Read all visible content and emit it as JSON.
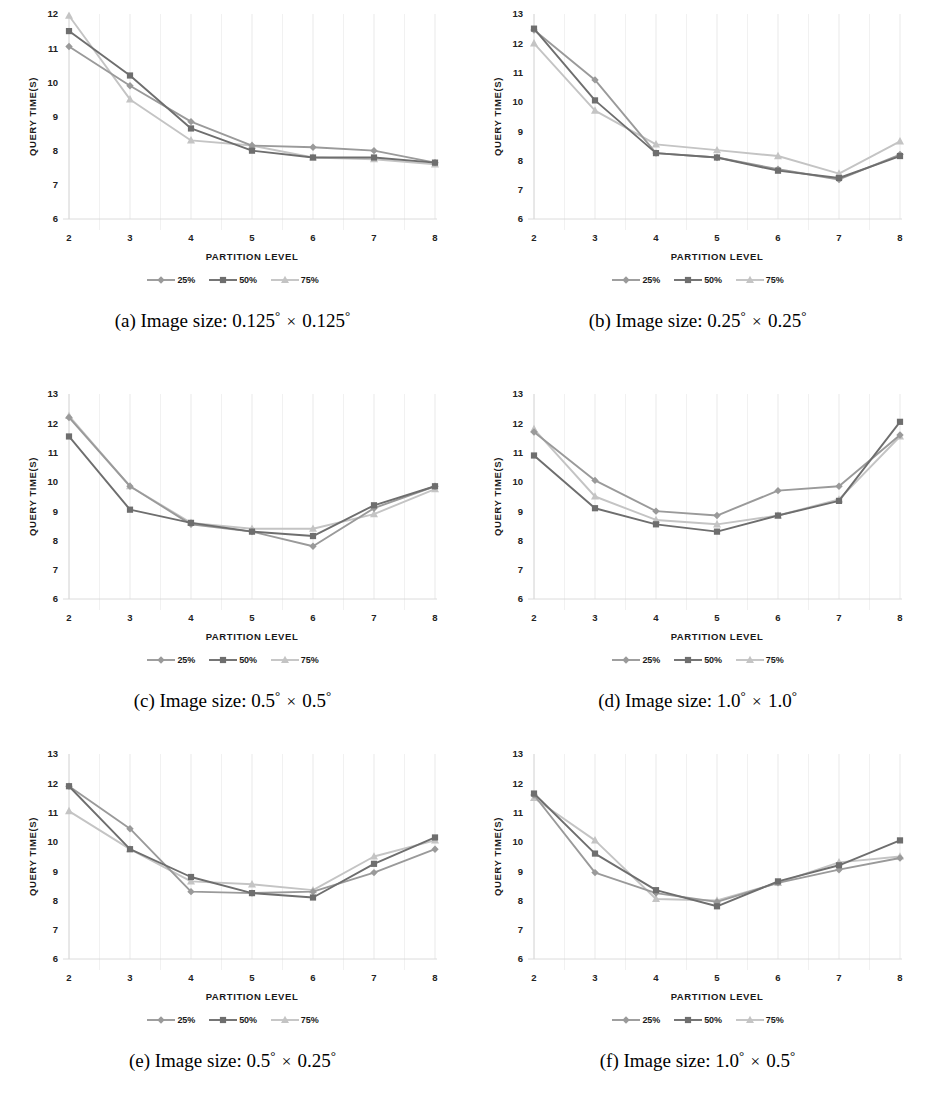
{
  "figure": {
    "series_colors": {
      "25%": "#9a9a9a",
      "50%": "#6e6e6e",
      "75%": "#c4c4c4"
    },
    "series_markers": {
      "25%": "diamond",
      "50%": "square",
      "75%": "triangle"
    },
    "axis": {
      "xlabel": "PARTITION  LEVEL",
      "ylabel": "QUERY TIME(S)"
    },
    "legend": [
      {
        "label": "25%",
        "marker": "diamond",
        "color": "#9a9a9a"
      },
      {
        "label": "50%",
        "marker": "square",
        "color": "#6e6e6e"
      },
      {
        "label": "75%",
        "marker": "triangle",
        "color": "#c4c4c4"
      }
    ],
    "panels": [
      {
        "key": "a",
        "caption_prefix": "(a) Image size:",
        "caption_left": "0.125",
        "caption_right": "0.125",
        "caption_full": "(a) Image size: 0.125° × 0.125°"
      },
      {
        "key": "b",
        "caption_prefix": "(b) Image size:",
        "caption_left": "0.25",
        "caption_right": "0.25",
        "caption_full": "(b) Image size: 0.25° × 0.25°"
      },
      {
        "key": "c",
        "caption_prefix": "(c) Image size:",
        "caption_left": "0.5",
        "caption_right": "0.5",
        "caption_full": "(c) Image size: 0.5° × 0.5°"
      },
      {
        "key": "d",
        "caption_prefix": "(d) Image size:",
        "caption_left": "1.0",
        "caption_right": "1.0",
        "caption_full": "(d) Image size: 1.0° × 1.0°"
      },
      {
        "key": "e",
        "caption_prefix": "(e) Image size:",
        "caption_left": "0.5",
        "caption_right": "0.25",
        "caption_full": "(e) Image size: 0.5° × 0.25°"
      },
      {
        "key": "f",
        "caption_prefix": "(f) Image size:",
        "caption_left": "1.0",
        "caption_right": "0.5",
        "caption_full": "(f) Image size: 1.0° × 0.5°"
      }
    ]
  },
  "chart_data": [
    {
      "id": "a",
      "type": "line",
      "title": "(a) Image size: 0.125° × 0.125°",
      "xlabel": "PARTITION  LEVEL",
      "ylabel": "QUERY TIME(S)",
      "x": [
        2,
        3,
        4,
        5,
        6,
        7,
        8
      ],
      "xticklabels": [
        "2",
        "3",
        "4",
        "5",
        "6",
        "7",
        "8"
      ],
      "yticks": [
        6,
        7,
        8,
        9,
        10,
        11,
        12
      ],
      "ylim": [
        6,
        12
      ],
      "grid": "vertical-light",
      "legend_position": "below",
      "series": [
        {
          "name": "25%",
          "values": [
            11.05,
            9.9,
            8.85,
            8.15,
            8.1,
            8.0,
            7.65
          ]
        },
        {
          "name": "50%",
          "values": [
            11.5,
            10.2,
            8.65,
            8.0,
            7.8,
            7.8,
            7.65
          ]
        },
        {
          "name": "75%",
          "values": [
            11.95,
            9.5,
            8.3,
            8.15,
            7.8,
            7.75,
            7.6
          ]
        }
      ]
    },
    {
      "id": "b",
      "type": "line",
      "title": "(b) Image size: 0.25° × 0.25°",
      "xlabel": "PARTITION  LEVEL",
      "ylabel": "QUERY TIME(S)",
      "x": [
        2,
        3,
        4,
        5,
        6,
        7,
        8
      ],
      "xticklabels": [
        "2",
        "3",
        "4",
        "5",
        "6",
        "7",
        "8"
      ],
      "yticks": [
        6,
        7,
        8,
        9,
        10,
        11,
        12,
        13
      ],
      "ylim": [
        6,
        13
      ],
      "grid": "vertical-light",
      "legend_position": "below",
      "series": [
        {
          "name": "25%",
          "values": [
            12.45,
            10.75,
            8.25,
            8.1,
            7.7,
            7.35,
            8.2
          ]
        },
        {
          "name": "50%",
          "values": [
            12.5,
            10.05,
            8.25,
            8.1,
            7.65,
            7.4,
            8.15
          ]
        },
        {
          "name": "75%",
          "values": [
            12.0,
            9.7,
            8.55,
            8.35,
            8.15,
            7.55,
            8.65
          ]
        }
      ]
    },
    {
      "id": "c",
      "type": "line",
      "title": "(c) Image size: 0.5° × 0.5°",
      "xlabel": "PARTITION  LEVEL",
      "ylabel": "QUERY TIME(S)",
      "x": [
        2,
        3,
        4,
        5,
        6,
        7,
        8
      ],
      "xticklabels": [
        "2",
        "3",
        "4",
        "5",
        "6",
        "7",
        "8"
      ],
      "yticks": [
        6,
        7,
        8,
        9,
        10,
        11,
        12,
        13
      ],
      "ylim": [
        6,
        13
      ],
      "grid": "vertical-light",
      "legend_position": "below",
      "series": [
        {
          "name": "25%",
          "values": [
            12.2,
            9.85,
            8.55,
            8.3,
            7.8,
            9.1,
            9.85
          ]
        },
        {
          "name": "50%",
          "values": [
            11.55,
            9.05,
            8.6,
            8.3,
            8.15,
            9.2,
            9.85
          ]
        },
        {
          "name": "75%",
          "values": [
            12.25,
            9.85,
            8.6,
            8.4,
            8.4,
            8.9,
            9.75
          ]
        }
      ]
    },
    {
      "id": "d",
      "type": "line",
      "title": "(d) Image size: 1.0° × 1.0°",
      "xlabel": "PARTITION  LEVEL",
      "ylabel": "QUERY TIME(S)",
      "x": [
        2,
        3,
        4,
        5,
        6,
        7,
        8
      ],
      "xticklabels": [
        "2",
        "3",
        "4",
        "5",
        "6",
        "7",
        "8"
      ],
      "yticks": [
        6,
        7,
        8,
        9,
        10,
        11,
        12,
        13
      ],
      "ylim": [
        6,
        13
      ],
      "grid": "vertical-light",
      "legend_position": "below",
      "series": [
        {
          "name": "25%",
          "values": [
            11.7,
            10.05,
            9.0,
            8.85,
            9.7,
            9.85,
            11.6
          ]
        },
        {
          "name": "50%",
          "values": [
            10.9,
            9.1,
            8.55,
            8.3,
            8.85,
            9.35,
            12.05
          ]
        },
        {
          "name": "75%",
          "values": [
            11.8,
            9.5,
            8.7,
            8.55,
            8.85,
            9.4,
            11.55
          ]
        }
      ]
    },
    {
      "id": "e",
      "type": "line",
      "title": "(e) Image size: 0.5° × 0.25°",
      "xlabel": "PARTITION  LEVEL",
      "ylabel": "QUERY TIME(S)",
      "x": [
        2,
        3,
        4,
        5,
        6,
        7,
        8
      ],
      "xticklabels": [
        "2",
        "3",
        "4",
        "5",
        "6",
        "7",
        "8"
      ],
      "yticks": [
        6,
        7,
        8,
        9,
        10,
        11,
        12,
        13
      ],
      "ylim": [
        6,
        13
      ],
      "grid": "vertical-light",
      "legend_position": "below",
      "series": [
        {
          "name": "25%",
          "values": [
            11.9,
            10.45,
            8.3,
            8.25,
            8.3,
            8.95,
            9.75
          ]
        },
        {
          "name": "50%",
          "values": [
            11.9,
            9.75,
            8.8,
            8.25,
            8.1,
            9.25,
            10.15
          ]
        },
        {
          "name": "75%",
          "values": [
            11.05,
            9.75,
            8.65,
            8.55,
            8.35,
            9.5,
            10.05
          ]
        }
      ]
    },
    {
      "id": "f",
      "type": "line",
      "title": "(f) Image size: 1.0° × 0.5°",
      "xlabel": "PARTITION  LEVEL",
      "ylabel": "QUERY TIME(S)",
      "x": [
        2,
        3,
        4,
        5,
        6,
        7,
        8
      ],
      "xticklabels": [
        "2",
        "3",
        "4",
        "5",
        "6",
        "7",
        "8"
      ],
      "yticks": [
        6,
        7,
        8,
        9,
        10,
        11,
        12,
        13
      ],
      "ylim": [
        6,
        13
      ],
      "grid": "vertical-light",
      "legend_position": "below",
      "series": [
        {
          "name": "25%",
          "values": [
            11.6,
            8.95,
            8.25,
            7.95,
            8.6,
            9.05,
            9.45
          ]
        },
        {
          "name": "50%",
          "values": [
            11.65,
            9.6,
            8.35,
            7.8,
            8.65,
            9.2,
            10.05
          ]
        },
        {
          "name": "75%",
          "values": [
            11.5,
            10.05,
            8.05,
            8.0,
            8.6,
            9.3,
            9.5
          ]
        }
      ]
    }
  ]
}
